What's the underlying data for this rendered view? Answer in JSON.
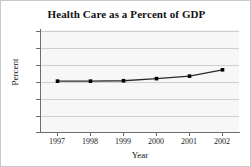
{
  "chart_data": {
    "type": "line",
    "title": "Health Care as a Percent of GDP",
    "xlabel": "Year",
    "ylabel": "Percent",
    "categories": [
      "1997",
      "1998",
      "1999",
      "2000",
      "2001",
      "2002"
    ],
    "x": [
      1997,
      1998,
      1999,
      2000,
      2001,
      2002
    ],
    "values": [
      12.2,
      12.2,
      12.3,
      12.8,
      13.4,
      14.9
    ],
    "series": [
      {
        "name": "Health Care as a Percent of GDP",
        "values": [
          12.2,
          12.2,
          12.3,
          12.8,
          13.4,
          14.9
        ]
      }
    ],
    "ylim": [
      0,
      24
    ],
    "xlim": [
      1996.5,
      2002.5
    ],
    "yticks": [
      0,
      4,
      8,
      12,
      16,
      20,
      24
    ],
    "ytick_labels": [
      "0",
      "4",
      "8",
      "12",
      "16",
      "20",
      "24"
    ],
    "xtick_labels": [
      "1997",
      "1998",
      "1999",
      "2000",
      "2001",
      "2002"
    ],
    "grid": "horizontal",
    "legend": "none",
    "marker": "square",
    "line_color": "#2b2b2b",
    "marker_color": "#000000",
    "grid_color": "#cfcfcf",
    "plot_background": "#f7f7f7",
    "figure_background": "#ffffff"
  }
}
